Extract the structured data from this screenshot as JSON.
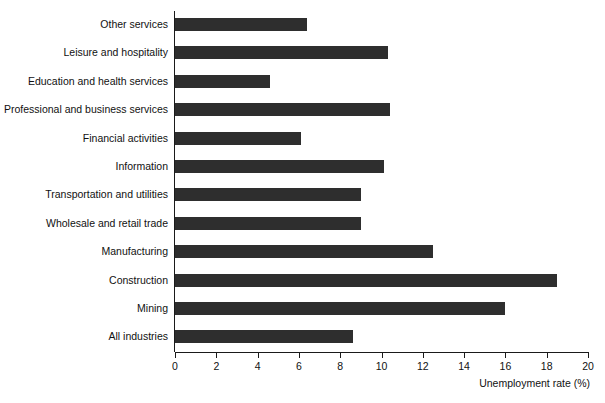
{
  "chart_data": {
    "type": "bar",
    "orientation": "horizontal",
    "title": "",
    "subtitle": "",
    "xlabel": "Unemployment rate (%)",
    "ylabel": "",
    "xlim": [
      0,
      20
    ],
    "xticks": [
      0,
      2,
      4,
      6,
      8,
      10,
      12,
      14,
      16,
      18,
      20
    ],
    "xtick_labels": [
      "0",
      "2",
      "4",
      "6",
      "8",
      "10",
      "12",
      "14",
      "16",
      "18",
      "20"
    ],
    "grid": false,
    "legend": null,
    "bar_color": "#2e2e2e",
    "axis_color": "#1a1a1a",
    "background": "#ffffff",
    "categories": [
      "Other services",
      "Leisure and hospitality",
      "Education and health services",
      "Professional and business services",
      "Financial activities",
      "Information",
      "Transportation and utilities",
      "Wholesale and retail trade",
      "Manufacturing",
      "Construction",
      "Mining",
      "All industries"
    ],
    "values": [
      6.4,
      10.3,
      4.6,
      10.4,
      6.1,
      10.1,
      9.0,
      9.0,
      12.5,
      18.5,
      16.0,
      8.6
    ],
    "bars": [
      {
        "category": "Other services",
        "value": 6.4
      },
      {
        "category": "Leisure and hospitality",
        "value": 10.3
      },
      {
        "category": "Education and health services",
        "value": 4.6
      },
      {
        "category": "Professional and business services",
        "value": 10.4
      },
      {
        "category": "Financial activities",
        "value": 6.1
      },
      {
        "category": "Information",
        "value": 10.1
      },
      {
        "category": "Transportation and utilities",
        "value": 9.0
      },
      {
        "category": "Wholesale and retail trade",
        "value": 9.0
      },
      {
        "category": "Manufacturing",
        "value": 12.5
      },
      {
        "category": "Construction",
        "value": 18.5
      },
      {
        "category": "Mining",
        "value": 16.0
      },
      {
        "category": "All industries",
        "value": 8.6
      }
    ]
  }
}
